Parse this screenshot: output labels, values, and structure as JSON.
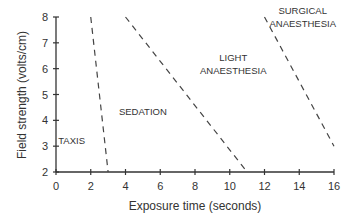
{
  "chart_data": {
    "type": "line",
    "title": "",
    "xlabel": "Exposure time (seconds)",
    "ylabel": "Field strength (volts/cm)",
    "xlim": [
      0,
      16
    ],
    "ylim": [
      2,
      8
    ],
    "x_ticks": [
      "0",
      "2",
      "4",
      "6",
      "8",
      "10",
      "12",
      "14",
      "16"
    ],
    "y_ticks": [
      "2",
      "3",
      "4",
      "5",
      "6",
      "7",
      "8"
    ],
    "grid": false,
    "legend": null,
    "series": [
      {
        "name": "Taxis/Sedation boundary",
        "style": "dashed",
        "points": [
          [
            2,
            8
          ],
          [
            3,
            2
          ]
        ]
      },
      {
        "name": "Sedation/Light anaesthesia boundary",
        "style": "dashed",
        "points": [
          [
            4,
            8
          ],
          [
            11,
            2
          ]
        ]
      },
      {
        "name": "Light/Surgical anaesthesia boundary",
        "style": "dashed",
        "points": [
          [
            12,
            8
          ],
          [
            16,
            3
          ]
        ]
      }
    ],
    "annotations": [
      {
        "text": "TAXIS",
        "x": 0.9,
        "y": 3.1
      },
      {
        "text": "SEDATION",
        "x": 5,
        "y": 4.2
      },
      {
        "text": "LIGHT",
        "x": 10.2,
        "y": 6.3
      },
      {
        "text": "ANAESTHESIA",
        "x": 10.2,
        "y": 5.8
      },
      {
        "text": "SURGICAL",
        "x": 14.2,
        "y": 8.1
      },
      {
        "text": "ANAESTHESIA",
        "x": 14.2,
        "y": 7.6
      }
    ]
  }
}
